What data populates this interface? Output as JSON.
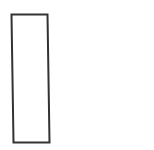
{
  "diagram": {
    "background": "#ffffff",
    "shapes": [
      {
        "type": "rectangle-outline",
        "points": [
          [
            11.5,
            14.5
          ],
          [
            47.5,
            14.5
          ],
          [
            49.5,
            142.5
          ],
          [
            13.5,
            142.5
          ]
        ],
        "stroke": "#333333",
        "stroke_width": 2,
        "fill": "none"
      }
    ]
  }
}
